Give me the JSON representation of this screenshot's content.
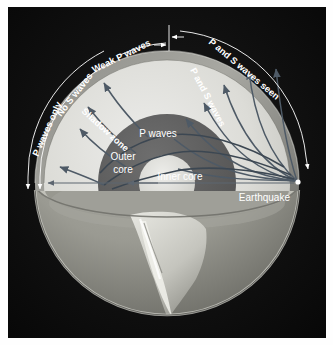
{
  "figure": {
    "panel_background": "#0d0d0d",
    "page_background": "#ffffff"
  },
  "colors": {
    "mantle": "#d9d9d4",
    "outer_core": "#5f5f5f",
    "inner_core": "#d9d9d4",
    "crust": "#7c7c78",
    "lower_globe": "#9a9a93",
    "ray": "#4e5a66",
    "label_text": "#ffffff",
    "panel": "#0d0d0d"
  },
  "arc_labels": [
    {
      "id": "p-waves-only",
      "text": "P waves only"
    },
    {
      "id": "no-s-waves",
      "text": "No S waves"
    },
    {
      "id": "weak-p-waves",
      "text": "Weak P waves"
    },
    {
      "id": "p-and-s-waves-seen",
      "text": "P and S waves seen"
    }
  ],
  "interior_labels": [
    {
      "id": "shadow-zone",
      "text": "Shadow zone"
    },
    {
      "id": "p-waves",
      "text": "P waves"
    },
    {
      "id": "p-and-s-waves",
      "text": "P and S waves"
    },
    {
      "id": "outer-core-line1",
      "text": "Outer"
    },
    {
      "id": "outer-core-line2",
      "text": "core"
    },
    {
      "id": "inner-core",
      "text": "Inner core"
    },
    {
      "id": "earthquake",
      "text": "Earthquake"
    }
  ],
  "layers": [
    {
      "id": "crust",
      "name": "Crust",
      "color": "#7c7c78"
    },
    {
      "id": "mantle",
      "name": "Mantle",
      "color": "#d9d9d4"
    },
    {
      "id": "outer-core",
      "name": "Outer core",
      "color": "#5f5f5f"
    },
    {
      "id": "inner-core",
      "name": "Inner core",
      "color": "#d9d9d4"
    }
  ],
  "source_marker": {
    "id": "earthquake-focus",
    "label": "Earthquake"
  }
}
